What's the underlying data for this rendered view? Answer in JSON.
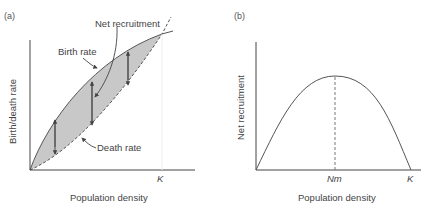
{
  "figure": {
    "panel_a": {
      "tag": "(a)",
      "y_label": "Birth/death rate",
      "x_label": "Population density",
      "x_tick": "K",
      "annotations": {
        "net_recruitment": "Net recruitment",
        "birth_rate": "Birth rate",
        "death_rate": "Death rate"
      },
      "colors": {
        "fill": "#c8c8c8",
        "line": "#555555"
      }
    },
    "panel_b": {
      "tag": "(b)",
      "y_label": "Net recruitment",
      "x_label": "Population density",
      "x_ticks": [
        "Nm",
        "K"
      ],
      "colors": {
        "line": "#555555"
      }
    }
  }
}
